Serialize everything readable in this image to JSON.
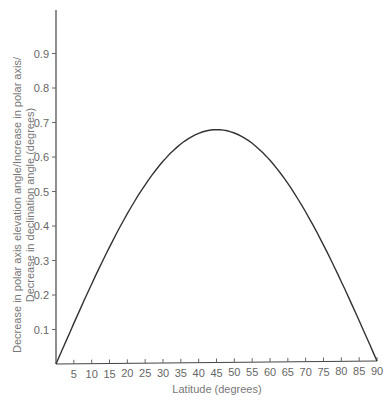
{
  "chart_data": {
    "type": "line",
    "title": "",
    "xlabel": "Latitude (degrees)",
    "ylabel": [
      "Decrease in polar axis elevation angle/Increase in polar axis/",
      "Decrease in declination angle (degrees)"
    ],
    "x": [
      0,
      5,
      10,
      15,
      20,
      25,
      30,
      35,
      40,
      45,
      50,
      55,
      60,
      65,
      70,
      75,
      80,
      85,
      90
    ],
    "series": [
      {
        "name": "Correction",
        "values": [
          0,
          0.12,
          0.23,
          0.34,
          0.43,
          0.52,
          0.58,
          0.63,
          0.67,
          0.675,
          0.67,
          0.63,
          0.58,
          0.52,
          0.43,
          0.34,
          0.23,
          0.12,
          0
        ]
      }
    ],
    "xlim": [
      0,
      90
    ],
    "ylim": [
      0,
      1.0
    ],
    "x_ticks": [
      "5",
      "10",
      "15",
      "20",
      "25",
      "30",
      "35",
      "40",
      "45",
      "50",
      "55",
      "60",
      "65",
      "70",
      "75",
      "80",
      "85",
      "90"
    ],
    "y_ticks": [
      "0.1",
      "0.2",
      "0.3",
      "0.4",
      "0.5",
      "0.6",
      "0.7",
      "0.8",
      "0.9"
    ],
    "grid": false,
    "legend": "none",
    "line_color": "#333333"
  }
}
